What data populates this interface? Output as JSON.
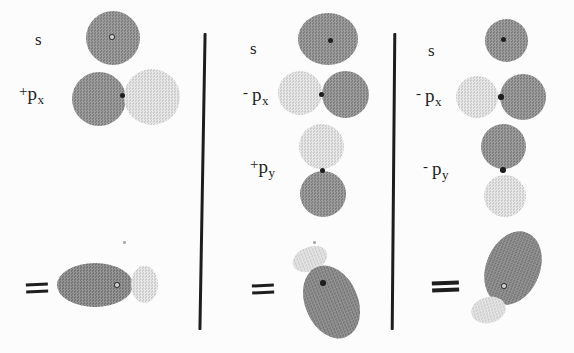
{
  "figure": {
    "colors": {
      "background": "#fcfcfc",
      "ink": "#1e1e1e",
      "dark": "#8c8c8c",
      "darker": "#828282",
      "light": "#e3e3e3"
    },
    "columns": [
      {
        "terms": [
          {
            "sign": "",
            "base": "s",
            "sub": ""
          },
          {
            "sign": "+",
            "base": "p",
            "sub": "x"
          }
        ],
        "equals_label": "="
      },
      {
        "terms": [
          {
            "sign": "",
            "base": "s",
            "sub": ""
          },
          {
            "sign": "-",
            "base": "p",
            "sub": "x"
          },
          {
            "sign": "+",
            "base": "p",
            "sub": "y"
          }
        ],
        "equals_label": "="
      },
      {
        "terms": [
          {
            "sign": "",
            "base": "s",
            "sub": ""
          },
          {
            "sign": "-",
            "base": "p",
            "sub": "x"
          },
          {
            "sign": "-",
            "base": "p",
            "sub": "y"
          }
        ],
        "equals_label": "="
      }
    ]
  }
}
